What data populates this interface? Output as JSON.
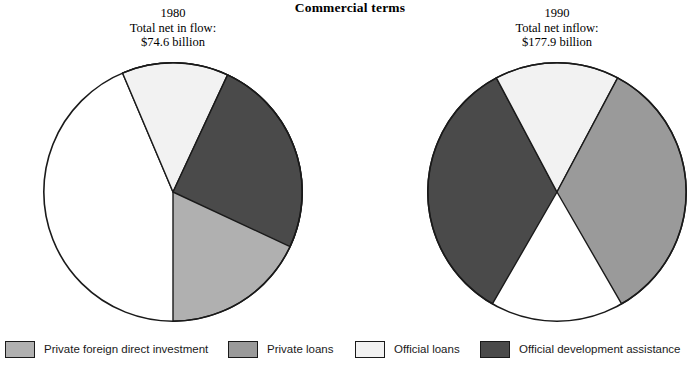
{
  "title": "Commercial terms",
  "panels": [
    {
      "year": "1980",
      "total_label": "Total net in flow:",
      "total_value": "$74.6 billion"
    },
    {
      "year": "1990",
      "total_label": "Total net inflow:",
      "total_value": "$177.9 billion"
    }
  ],
  "legend": {
    "items": [
      {
        "label": "Private foreign direct investment",
        "color": "#b0b0b0",
        "swatch_name": "legend-swatch-private-foreign-direct-investment"
      },
      {
        "label": "Private loans",
        "color": "#9a9a9a",
        "swatch_name": "legend-swatch-private-loans"
      },
      {
        "label": "Official loans",
        "color": "#f2f2f2",
        "swatch_name": "legend-swatch-official-loans"
      },
      {
        "label": "Official development assistance",
        "color": "#4a4a4a",
        "swatch_name": "legend-swatch-official-development-assistance"
      }
    ]
  },
  "chart_data": [
    {
      "type": "pie",
      "title": "1980",
      "subtitle": "Total net in flow: $74.6 billion",
      "total": 74.6,
      "total_units": "billion USD",
      "legend_position": "bottom",
      "categories": [
        "Private foreign direct investment",
        "Private loans",
        "Official loans",
        "Official development assistance"
      ],
      "values": [
        0,
        43,
        31,
        26
      ],
      "value_units": "percent",
      "slices": [
        {
          "label": "Private loans",
          "percent": 43,
          "start_angle": 337,
          "end_angle": 180,
          "color": "#b0b0b0"
        },
        {
          "label": "Official loans",
          "percent": 31,
          "start_angle": 337,
          "end_angle": 25,
          "color": "#f2f2f2",
          "note": "split across top and bottom of vertical axis"
        },
        {
          "label": "Official development assistance",
          "percent": 26,
          "start_angle": 25,
          "end_angle": 115,
          "color": "#4a4a4a"
        }
      ]
    },
    {
      "type": "pie",
      "title": "1990",
      "subtitle": "Total net inflow: $177.9 billion",
      "total": 177.9,
      "total_units": "billion USD",
      "legend_position": "bottom",
      "categories": [
        "Private foreign direct investment",
        "Private loans",
        "Official loans",
        "Official development assistance"
      ],
      "values": [
        0,
        33,
        32,
        35
      ],
      "value_units": "percent",
      "slices": [
        {
          "label": "Official development assistance",
          "percent": 35,
          "start_angle": 210,
          "end_angle": 332,
          "color": "#4a4a4a"
        },
        {
          "label": "Official loans",
          "percent": 32,
          "start_angle": 332,
          "end_angle": 28,
          "color": "#f2f2f2",
          "note": "split across top and bottom of vertical axis"
        },
        {
          "label": "Private loans",
          "percent": 33,
          "start_angle": 28,
          "end_angle": 150,
          "color": "#9a9a9a"
        }
      ]
    }
  ]
}
